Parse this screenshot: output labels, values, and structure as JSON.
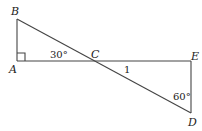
{
  "diagram": {
    "points": {
      "A": {
        "label": "A",
        "x": 17,
        "y": 61
      },
      "B": {
        "label": "B",
        "x": 17,
        "y": 19
      },
      "C": {
        "label": "C",
        "x": 93,
        "y": 61
      },
      "D": {
        "label": "D",
        "x": 191,
        "y": 113
      },
      "E": {
        "label": "E",
        "x": 191,
        "y": 61
      }
    },
    "segments": [
      "AB",
      "AE",
      "BD",
      "ED"
    ],
    "annotations": {
      "angle_BCA": "30°",
      "angle_CDE": "60°",
      "side_CD": "1",
      "right_angle_at": "A"
    }
  }
}
